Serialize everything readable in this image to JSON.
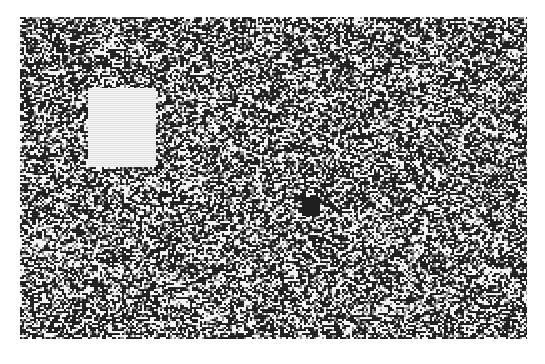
{
  "figure": {
    "noise_panel": {
      "x": 20,
      "y": 17,
      "width": 507,
      "height": 322,
      "dot_size": 2,
      "seed": 1337,
      "dark_color": "#1a1a1a",
      "light_color": "#f2f2f2",
      "mid_color": "#8a8a8a"
    },
    "light_square": {
      "x": 88,
      "y": 88,
      "width": 68,
      "height": 79,
      "color": "#ececec"
    },
    "dark_square": {
      "x": 302,
      "y": 197,
      "width": 18,
      "height": 19,
      "color": "#1e1e1e"
    },
    "background_color": "#ffffff"
  },
  "caption": {
    "text": ""
  }
}
